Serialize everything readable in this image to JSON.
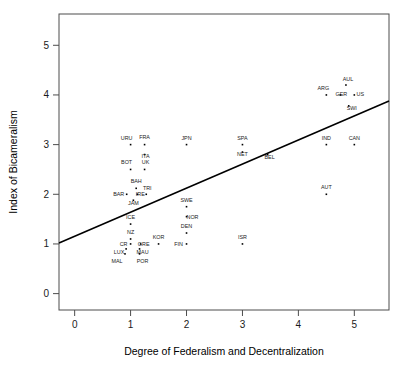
{
  "chart_data": {
    "type": "scatter",
    "title": "",
    "xlabel": "Degree of Federalism and Decentralization",
    "ylabel": "Index of Bicameralism",
    "xlim": [
      -0.28,
      5.62
    ],
    "ylim": [
      -0.33,
      5.63
    ],
    "xticks": [
      0,
      1,
      2,
      3,
      4,
      5
    ],
    "yticks": [
      0,
      1,
      2,
      3,
      4,
      5
    ],
    "xticklabels": [
      "0",
      "1",
      "2",
      "3",
      "4",
      "5"
    ],
    "yticklabels": [
      "0",
      "1",
      "2",
      "3",
      "4",
      "5"
    ],
    "grid": false,
    "legend": "none",
    "points": [
      {
        "label": "URU",
        "x": 1.0,
        "y": 3.0,
        "lx": -4,
        "ly": -5
      },
      {
        "label": "FRA",
        "x": 1.25,
        "y": 3.0,
        "lx": 0,
        "ly": -6
      },
      {
        "label": "ITA",
        "x": 1.25,
        "y": 2.8,
        "lx": 1,
        "ly": 3
      },
      {
        "label": "JPN",
        "x": 2.0,
        "y": 3.0,
        "lx": 0,
        "ly": -5
      },
      {
        "label": "SPA",
        "x": 3.0,
        "y": 3.0,
        "lx": 0,
        "ly": -5
      },
      {
        "label": "NET",
        "x": 3.0,
        "y": 2.85,
        "lx": 0,
        "ly": 4
      },
      {
        "label": "BEL",
        "x": 3.45,
        "y": 2.8,
        "lx": 2,
        "ly": 4
      },
      {
        "label": "IND",
        "x": 4.5,
        "y": 3.0,
        "lx": 0,
        "ly": -5
      },
      {
        "label": "CAN",
        "x": 5.0,
        "y": 3.0,
        "lx": 0,
        "ly": -5
      },
      {
        "label": "ARG",
        "x": 4.5,
        "y": 4.0,
        "lx": -3,
        "ly": -5
      },
      {
        "label": "GER",
        "x": 4.75,
        "y": 4.0,
        "lx": 1,
        "ly": 1
      },
      {
        "label": "AUL",
        "x": 4.85,
        "y": 4.2,
        "lx": 2,
        "ly": -4
      },
      {
        "label": "US",
        "x": 5.0,
        "y": 4.0,
        "lx": 6,
        "ly": 1
      },
      {
        "label": "SWI",
        "x": 4.9,
        "y": 3.78,
        "lx": 3,
        "ly": 4
      },
      {
        "label": "BOT",
        "x": 1.0,
        "y": 2.5,
        "lx": -4,
        "ly": -5
      },
      {
        "label": "UK",
        "x": 1.25,
        "y": 2.5,
        "lx": 1,
        "ly": -5
      },
      {
        "label": "BAH",
        "x": 1.1,
        "y": 2.12,
        "lx": 0,
        "ly": -5
      },
      {
        "label": "BAR",
        "x": 0.93,
        "y": 2.0,
        "lx": -8,
        "ly": 2
      },
      {
        "label": "IRE",
        "x": 1.12,
        "y": 2.0,
        "lx": 3,
        "ly": 2
      },
      {
        "label": "TRI",
        "x": 1.28,
        "y": 2.0,
        "lx": 1,
        "ly": -4
      },
      {
        "label": "JAM",
        "x": 1.05,
        "y": 1.88,
        "lx": 0,
        "ly": 5
      },
      {
        "label": "AUT",
        "x": 4.5,
        "y": 2.0,
        "lx": 0,
        "ly": -5
      },
      {
        "label": "SWE",
        "x": 2.0,
        "y": 1.75,
        "lx": 0,
        "ly": -5
      },
      {
        "label": "NOR",
        "x": 2.0,
        "y": 1.55,
        "lx": 6,
        "ly": 2
      },
      {
        "label": "ICE",
        "x": 1.0,
        "y": 1.4,
        "lx": 0,
        "ly": -5
      },
      {
        "label": "DEN",
        "x": 2.0,
        "y": 1.22,
        "lx": 0,
        "ly": -5
      },
      {
        "label": "NZ",
        "x": 1.0,
        "y": 1.1,
        "lx": 0,
        "ly": -5
      },
      {
        "label": "KOR",
        "x": 1.5,
        "y": 1.0,
        "lx": 0,
        "ly": -5
      },
      {
        "label": "FIN",
        "x": 2.0,
        "y": 1.0,
        "lx": -8,
        "ly": 2
      },
      {
        "label": "ISR",
        "x": 3.0,
        "y": 1.0,
        "lx": 0,
        "ly": -5
      },
      {
        "label": "CR",
        "x": 1.0,
        "y": 1.0,
        "lx": -7,
        "ly": 2
      },
      {
        "label": "GRE",
        "x": 1.18,
        "y": 1.0,
        "lx": 3,
        "ly": 2
      },
      {
        "label": "LUX",
        "x": 0.92,
        "y": 0.9,
        "lx": -7,
        "ly": 5
      },
      {
        "label": "MAU",
        "x": 1.16,
        "y": 0.9,
        "lx": 3,
        "ly": 5
      },
      {
        "label": "MAL",
        "x": 0.9,
        "y": 0.8,
        "lx": -8,
        "ly": 9
      },
      {
        "label": "POR",
        "x": 1.16,
        "y": 0.8,
        "lx": 3,
        "ly": 9
      }
    ],
    "fit_line": {
      "x0": -0.28,
      "y0": 1.02,
      "x1": 5.62,
      "y1": 3.88
    }
  }
}
